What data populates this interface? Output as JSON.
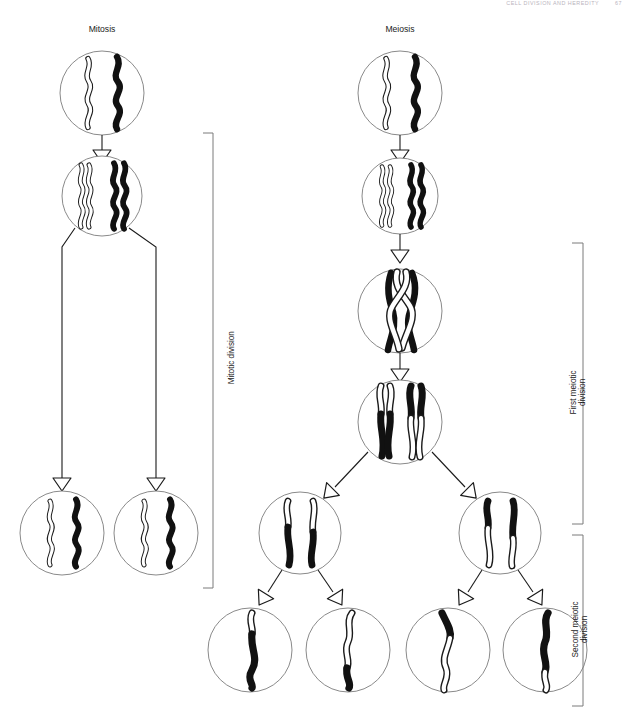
{
  "page": {
    "running_head": "CELL DIVISION AND HEREDITY",
    "page_number": "67"
  },
  "columns": {
    "mitosis_title": "Mitosis",
    "meiosis_title": "Meiosis"
  },
  "brackets": {
    "mitotic": "Mitotic division",
    "first_meiotic_line1": "First meiotic",
    "first_meiotic_line2": "division",
    "second_meiotic_line1": "Second meiotic",
    "second_meiotic_line2": "division"
  },
  "colors": {
    "outline": "#1b1b1b",
    "chromosome_black": "#111111",
    "chromosome_white": "#ffffff",
    "cell_stroke": "#8a8a8a",
    "bracket": "#7a7a7a",
    "running_head": "#b9b4bd"
  },
  "diagram": {
    "type": "biology-process-diagram",
    "mitosis_stages": [
      {
        "name": "parent-cell",
        "chromosomes": [
          "white-single",
          "black-single"
        ]
      },
      {
        "name": "replicated-cell",
        "chromosomes": [
          "white-double",
          "black-double"
        ]
      },
      {
        "name": "daughter-cell-1",
        "chromosomes": [
          "white-single",
          "black-single"
        ]
      },
      {
        "name": "daughter-cell-2",
        "chromosomes": [
          "white-single",
          "black-single"
        ]
      }
    ],
    "meiosis_stages": [
      {
        "name": "parent-cell",
        "chromosomes": [
          "white-single",
          "black-single"
        ]
      },
      {
        "name": "replicated-cell",
        "chromosomes": [
          "white-double",
          "black-double"
        ]
      },
      {
        "name": "crossing-over-cell",
        "chromosomes": [
          "white-double-crossed",
          "black-double-crossed"
        ]
      },
      {
        "name": "recombinant-cell",
        "chromosomes": [
          "recombinant-white-black",
          "recombinant-black-white"
        ]
      },
      {
        "name": "secondary-cell-left",
        "chromosomes": [
          "recombinant-a",
          "recombinant-b"
        ]
      },
      {
        "name": "secondary-cell-right",
        "chromosomes": [
          "recombinant-c",
          "recombinant-d"
        ]
      },
      {
        "name": "gamete-1",
        "chromosomes": [
          "white-tip-black-body"
        ]
      },
      {
        "name": "gamete-2",
        "chromosomes": [
          "white-body-black-tip"
        ]
      },
      {
        "name": "gamete-3",
        "chromosomes": [
          "black-tip-white-body"
        ]
      },
      {
        "name": "gamete-4",
        "chromosomes": [
          "black-body-white-tip"
        ]
      }
    ]
  }
}
